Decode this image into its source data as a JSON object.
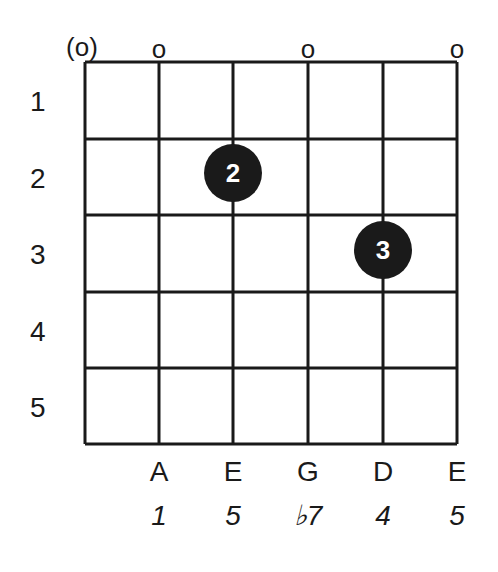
{
  "chord": {
    "open_markers": [
      "(o)",
      "o",
      "",
      "o",
      "",
      "o"
    ],
    "fret_numbers": [
      "1",
      "2",
      "3",
      "4",
      "5"
    ],
    "fingers": [
      {
        "string": 3,
        "fret": 2,
        "label": "2"
      },
      {
        "string": 5,
        "fret": 3,
        "label": "3"
      }
    ],
    "note_names": [
      "",
      "A",
      "E",
      "G",
      "D",
      "E"
    ],
    "intervals": [
      "",
      "1",
      "5",
      "♭7",
      "4",
      "5"
    ],
    "colors": {
      "ink": "#1a1a1a",
      "background": "#ffffff"
    }
  }
}
